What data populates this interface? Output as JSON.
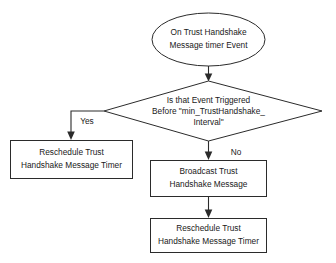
{
  "diagram": {
    "background_color": "#ffffff",
    "line_color": "#2b2b2b",
    "text_color": "#1a1a1a",
    "nodes": {
      "start": {
        "shape": "ellipse",
        "line1": "On Trust Handshake",
        "line2": "Message timer Event"
      },
      "decision": {
        "shape": "diamond",
        "line1": "Is that Event Triggered",
        "line2": "Before \"min_TrustHandshake_",
        "line3": "Interval\""
      },
      "yes_process": {
        "shape": "rectangle",
        "line1": "Reschedule Trust",
        "line2": "Handshake Message Timer"
      },
      "broadcast_process": {
        "shape": "rectangle",
        "line1": "Broadcast Trust",
        "line2": "Handshake Message"
      },
      "reschedule_process": {
        "shape": "rectangle",
        "line1": "Reschedule Trust",
        "line2": "Handshake Message Timer"
      }
    },
    "edge_labels": {
      "yes": "Yes",
      "no": "No"
    }
  }
}
